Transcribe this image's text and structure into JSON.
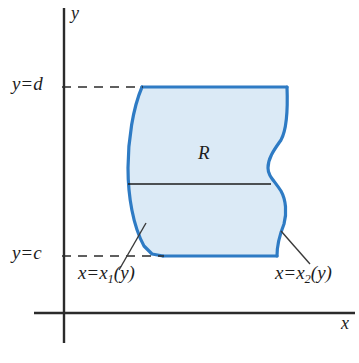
{
  "figure": {
    "axes": {
      "y_axis_label": "y",
      "x_axis_label": "x",
      "axis_color": "#2b2b2b",
      "origin_x": 64,
      "origin_y": 313
    },
    "region": {
      "label": "R",
      "fill_color": "#dbeaf6",
      "stroke_color": "#2e7bc4",
      "stroke_width": 3.2
    },
    "gridlines": [
      {
        "name": "y-equals-d",
        "label_y": "y",
        "label_eq": "=",
        "label_val": "d",
        "pixel_y": 87,
        "style": "dashed"
      },
      {
        "name": "y-equals-c",
        "label_y": "y",
        "label_eq": "=",
        "label_val": "c",
        "pixel_y": 256,
        "style": "dashed"
      }
    ],
    "curve_labels": [
      {
        "name": "left-curve",
        "lhs": "x",
        "eq": "=",
        "fn": "x",
        "sub": "1",
        "arg": "(y)"
      },
      {
        "name": "right-curve",
        "lhs": "x",
        "eq": "=",
        "fn": "x",
        "sub": "2",
        "arg": "(y)"
      }
    ],
    "chord": {
      "name": "horizontal-slice",
      "pixel_y": 184,
      "x_start": 128,
      "x_end": 271,
      "color": "#1d1d1d"
    },
    "leaders": [
      {
        "name": "left-leader",
        "x1": 146,
        "y1": 223,
        "x2": 119,
        "y2": 270
      },
      {
        "name": "right-leader",
        "x1": 281,
        "y1": 231,
        "x2": 310,
        "y2": 264
      }
    ]
  }
}
